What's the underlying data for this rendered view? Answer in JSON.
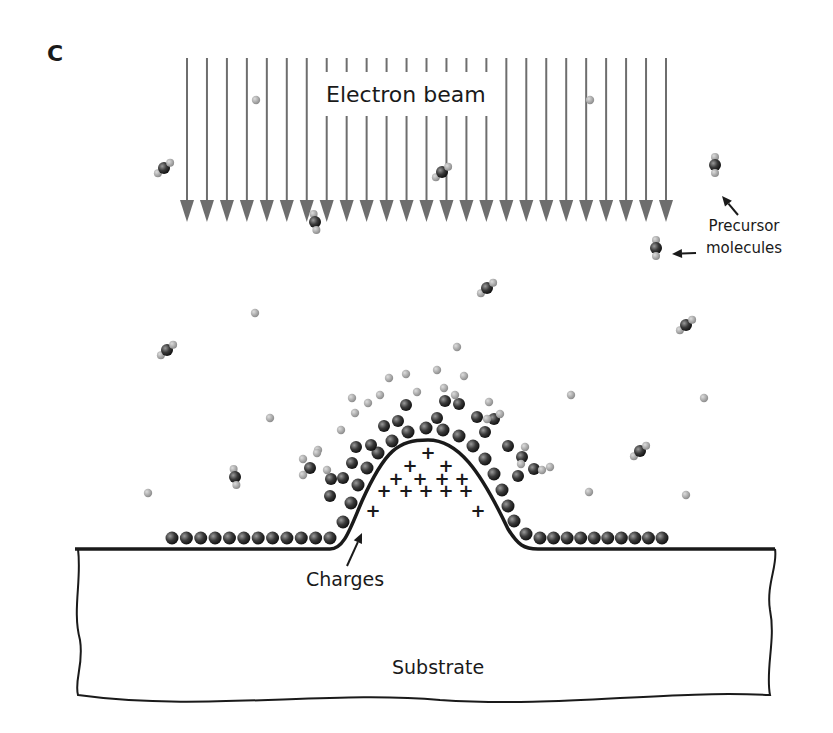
{
  "figure": {
    "panel_letter": "C",
    "labels": {
      "electron_beam": "Electron beam",
      "precursor_line1": "Precursor",
      "precursor_line2": "molecules",
      "charges": "Charges",
      "substrate": "Substrate"
    },
    "colors": {
      "beam_arrow": "#6e6e6e",
      "outline": "#1a1a1a",
      "deposit_atom": "#3a3a3a",
      "ligand_atom": "#a8a8a8",
      "background": "#ffffff"
    },
    "beam": {
      "arrow_count": 25,
      "x_start": 187,
      "x_end": 666,
      "y_top": 58,
      "y_tip": 222,
      "label_gap_y": [
        72,
        116
      ],
      "label_gap_x": [
        318,
        500
      ]
    },
    "surface": {
      "baseline_y": 549,
      "dome_left_x": 330,
      "dome_right_x": 530,
      "dome_peak_x": 428,
      "dome_peak_y": 440
    },
    "deposit_rows": {
      "left": {
        "x_from": 172,
        "x_to": 330,
        "count": 12,
        "y": 538
      },
      "right": {
        "x_from": 540,
        "x_to": 662,
        "count": 10,
        "y": 538
      }
    },
    "charges": {
      "symbol": "+",
      "positions": [
        [
          428,
          453
        ],
        [
          410,
          466
        ],
        [
          446,
          466
        ],
        [
          396,
          479
        ],
        [
          420,
          479
        ],
        [
          442,
          479
        ],
        [
          462,
          479
        ],
        [
          384,
          491
        ],
        [
          406,
          491
        ],
        [
          426,
          491
        ],
        [
          446,
          491
        ],
        [
          466,
          491
        ],
        [
          373,
          511
        ],
        [
          478,
          511
        ]
      ]
    },
    "free_molecules": [
      [
        164,
        168,
        -40
      ],
      [
        315,
        222,
        80
      ],
      [
        442,
        172,
        -40
      ],
      [
        715,
        165,
        90
      ],
      [
        656,
        248,
        90
      ],
      [
        487,
        288,
        -40
      ],
      [
        686,
        325,
        -40
      ],
      [
        167,
        350,
        -40
      ],
      [
        235,
        477,
        80
      ],
      [
        640,
        451,
        -40
      ]
    ],
    "free_atoms": [
      [
        256,
        100
      ],
      [
        590,
        100
      ],
      [
        255,
        313
      ],
      [
        457,
        347
      ],
      [
        270,
        418
      ],
      [
        571,
        395
      ],
      [
        704,
        398
      ],
      [
        148,
        493
      ],
      [
        589,
        492
      ],
      [
        686,
        495
      ],
      [
        317,
        453
      ]
    ],
    "arrows": [
      {
        "from": [
          738,
          215
        ],
        "to": [
          722,
          196
        ]
      },
      {
        "from": [
          696,
          253
        ],
        "to": [
          672,
          254
        ]
      },
      {
        "from": [
          347,
          566
        ],
        "to": [
          362,
          533
        ]
      }
    ]
  }
}
